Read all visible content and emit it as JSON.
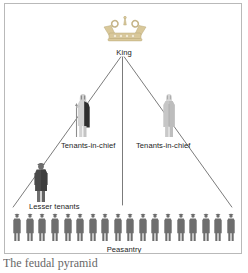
{
  "figure": {
    "caption": "The feudal pyramid",
    "border_color": "#b9b9b9",
    "background_color": "#ffffff"
  },
  "diagram": {
    "type": "hierarchy-pyramid",
    "title": "The feudal pyramid",
    "levels": [
      {
        "id": "king",
        "label": "King",
        "rank": 1,
        "icon": "crown-icon",
        "icon_color": "#d9c89a",
        "count": 1
      },
      {
        "id": "tenants-in-chief-left",
        "label": "Tenants-in-chief",
        "rank": 2,
        "icon": "knight-figure-icon",
        "icon_color": "#3f3f3f",
        "count": 1
      },
      {
        "id": "tenants-in-chief-right",
        "label": "Tenants-in-chief",
        "rank": 2,
        "icon": "cleric-figure-icon",
        "icon_color": "#c8c8c8",
        "count": 1
      },
      {
        "id": "lesser-tenants",
        "label": "Lesser tenants",
        "rank": 3,
        "icon": "person-figure-icon",
        "icon_color": "#5a5a5a",
        "count": 1
      },
      {
        "id": "peasantry",
        "label": "Peasantry",
        "rank": 4,
        "icon": "peasant-figure-icon",
        "icon_color": "#6e6e6e",
        "count": 18
      }
    ],
    "labels": {
      "king": "King",
      "tenants_in_chief_left": "Tenants-in-chief",
      "tenants_in_chief_right": "Tenants-in-chief",
      "lesser_tenants": "Lesser tenants",
      "peasantry": "Peasantry"
    },
    "line_color": "#6b6b6b"
  }
}
